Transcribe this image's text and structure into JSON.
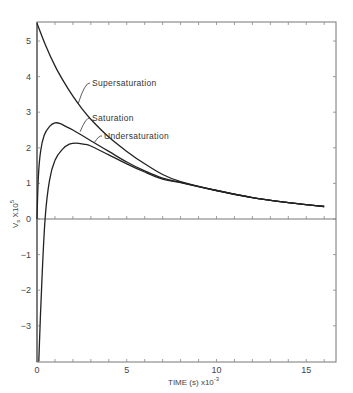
{
  "chart_data": {
    "type": "line",
    "title": "",
    "xlabel": "TIME (s) x10^-3",
    "ylabel": "Vs X10^5",
    "xlim": [
      0,
      16.5
    ],
    "ylim": [
      -4,
      5.5
    ],
    "xticks": [
      0,
      5,
      10,
      15
    ],
    "xtick_labels": [
      "0",
      "5",
      "10",
      "15"
    ],
    "yticks": [
      -3,
      -2,
      -1,
      0,
      1,
      2,
      3,
      4,
      5
    ],
    "ytick_labels": [
      "-3",
      "-2",
      "-1",
      "0",
      "1",
      "2",
      "3",
      "4",
      "5"
    ],
    "grid": false,
    "legend": "none (inline annotations)",
    "series": [
      {
        "name": "Supersaturation",
        "x": [
          0,
          0.5,
          1,
          1.5,
          2,
          2.5,
          3,
          4,
          5,
          6,
          7,
          8,
          10,
          12,
          14,
          16
        ],
        "y": [
          5.5,
          4.85,
          4.3,
          3.85,
          3.45,
          3.1,
          2.8,
          2.3,
          1.9,
          1.55,
          1.25,
          1.05,
          0.8,
          0.6,
          0.46,
          0.35
        ]
      },
      {
        "name": "Saturation",
        "x": [
          0,
          0.08,
          0.2,
          0.4,
          0.7,
          1.0,
          1.3,
          1.6,
          2,
          3,
          4,
          5,
          6,
          7,
          8,
          10,
          12,
          14,
          16
        ],
        "y": [
          0,
          1.2,
          1.9,
          2.35,
          2.6,
          2.7,
          2.68,
          2.6,
          2.5,
          2.2,
          1.9,
          1.6,
          1.35,
          1.15,
          1.03,
          0.8,
          0.6,
          0.46,
          0.35
        ]
      },
      {
        "name": "Undersaturation",
        "x": [
          0.1,
          0.25,
          0.45,
          0.7,
          1.0,
          1.4,
          1.8,
          2.2,
          2.6,
          3,
          4,
          5,
          6,
          7,
          8,
          10,
          12,
          14,
          16
        ],
        "y": [
          -4.0,
          -2.0,
          0,
          1.1,
          1.65,
          1.95,
          2.1,
          2.13,
          2.1,
          2.05,
          1.8,
          1.55,
          1.32,
          1.12,
          1.02,
          0.8,
          0.6,
          0.46,
          0.35
        ]
      }
    ],
    "annotations": [
      {
        "text": "Supersaturation",
        "points_to": [
          2.3,
          3.25
        ]
      },
      {
        "text": "Saturation",
        "points_to": [
          2.4,
          2.45
        ]
      },
      {
        "text": "Undersaturation",
        "points_to": [
          3.2,
          2.15
        ]
      }
    ]
  },
  "labels": {
    "ylabel_main": "V",
    "ylabel_sub": "s",
    "ylabel_rest": " X10",
    "ylabel_exp": "5",
    "xlabel_main": "TIME (s) x10",
    "xlabel_exp": "-3",
    "zero_x": "0"
  }
}
